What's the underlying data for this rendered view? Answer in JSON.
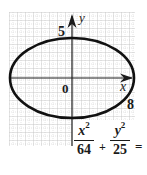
{
  "figure": {
    "type": "ellipse-graph",
    "grid": {
      "color": "#b8b8b8",
      "minor_color": "#d0d0d0",
      "major_spacing_px": 8
    },
    "axes": {
      "x_label": "x",
      "y_label": "y",
      "origin_label": "0",
      "x_intercept_label": "8",
      "y_intercept_label": "5"
    },
    "ellipse": {
      "a": 8,
      "b": 5,
      "stroke_color": "#111111"
    }
  },
  "equation": {
    "term1": {
      "numerator_var": "x",
      "numerator_exp": "2",
      "denominator": "64"
    },
    "operator": "+",
    "term2": {
      "numerator_var": "y",
      "numerator_exp": "2",
      "denominator": "25"
    },
    "equals": "="
  }
}
